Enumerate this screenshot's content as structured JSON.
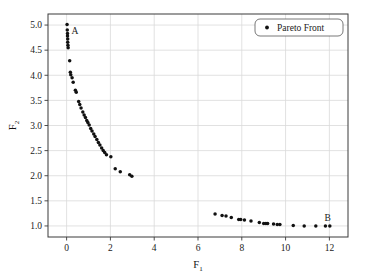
{
  "chart_data": {
    "type": "scatter",
    "title": "",
    "xlabel": "F1",
    "xlabel_base": "F",
    "xlabel_sub": "1",
    "ylabel": "F2",
    "ylabel_base": "F",
    "ylabel_sub": "2",
    "xlim": [
      -0.85,
      12.85
    ],
    "ylim": [
      0.78,
      5.22
    ],
    "xticks": [
      0,
      2,
      4,
      6,
      8,
      10,
      12
    ],
    "xtick_labels": [
      "0",
      "2",
      "4",
      "6",
      "8",
      "10",
      "12"
    ],
    "yticks": [
      1.0,
      1.5,
      2.0,
      2.5,
      3.0,
      3.5,
      4.0,
      4.5,
      5.0
    ],
    "ytick_labels": [
      "1.0",
      "1.5",
      "2.0",
      "2.5",
      "3.0",
      "3.5",
      "4.0",
      "4.5",
      "5.0"
    ],
    "grid": true,
    "legend_position": "upper-right",
    "marker_color": "#111111",
    "grid_color": "#d9d9d9",
    "frame_color": "#3a3a3a",
    "series": [
      {
        "name": "Pareto Front",
        "marker": "circle",
        "color": "#111111",
        "points": [
          [
            0.02,
            5.01
          ],
          [
            0.03,
            4.9
          ],
          [
            0.04,
            4.83
          ],
          [
            0.04,
            4.78
          ],
          [
            0.05,
            4.72
          ],
          [
            0.05,
            4.66
          ],
          [
            0.06,
            4.6
          ],
          [
            0.07,
            4.55
          ],
          [
            0.14,
            4.29
          ],
          [
            0.17,
            4.06
          ],
          [
            0.19,
            4.01
          ],
          [
            0.25,
            3.95
          ],
          [
            0.3,
            3.86
          ],
          [
            0.4,
            3.7
          ],
          [
            0.44,
            3.66
          ],
          [
            0.55,
            3.48
          ],
          [
            0.6,
            3.42
          ],
          [
            0.66,
            3.35
          ],
          [
            0.74,
            3.27
          ],
          [
            0.8,
            3.21
          ],
          [
            0.86,
            3.16
          ],
          [
            0.92,
            3.1
          ],
          [
            0.97,
            3.06
          ],
          [
            1.03,
            3.01
          ],
          [
            1.1,
            2.94
          ],
          [
            1.16,
            2.89
          ],
          [
            1.24,
            2.83
          ],
          [
            1.3,
            2.78
          ],
          [
            1.38,
            2.72
          ],
          [
            1.45,
            2.66
          ],
          [
            1.52,
            2.61
          ],
          [
            1.6,
            2.55
          ],
          [
            1.67,
            2.5
          ],
          [
            1.74,
            2.46
          ],
          [
            1.82,
            2.42
          ],
          [
            2.02,
            2.38
          ],
          [
            2.22,
            2.14
          ],
          [
            2.45,
            2.08
          ],
          [
            2.88,
            2.02
          ],
          [
            2.98,
            1.99
          ],
          [
            6.78,
            1.24
          ],
          [
            7.1,
            1.21
          ],
          [
            7.28,
            1.2
          ],
          [
            7.52,
            1.17
          ],
          [
            7.86,
            1.13
          ],
          [
            7.95,
            1.13
          ],
          [
            8.12,
            1.12
          ],
          [
            8.42,
            1.1
          ],
          [
            8.8,
            1.07
          ],
          [
            9.0,
            1.05
          ],
          [
            9.1,
            1.05
          ],
          [
            9.18,
            1.05
          ],
          [
            9.45,
            1.04
          ],
          [
            9.62,
            1.03
          ],
          [
            9.74,
            1.03
          ],
          [
            10.35,
            1.01
          ],
          [
            10.85,
            1.0
          ],
          [
            11.38,
            1.0
          ],
          [
            11.82,
            1.0
          ],
          [
            12.02,
            1.0
          ]
        ]
      }
    ],
    "annotations": [
      {
        "label": "A",
        "x": 0.38,
        "y": 4.88
      },
      {
        "label": "B",
        "x": 11.92,
        "y": 1.16
      }
    ]
  },
  "legend": {
    "entries": [
      {
        "label": "Pareto Front",
        "marker": "circle",
        "color": "#111111"
      }
    ]
  }
}
